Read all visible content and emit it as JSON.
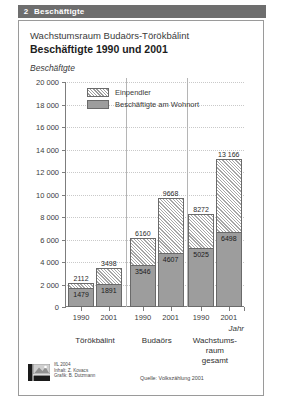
{
  "header": {
    "number": "2",
    "title": "Beschäftigte"
  },
  "figure": {
    "title": "Wachstumsraum Budaörs-Törökbálint",
    "subtitle": "Beschäftigte 1990 und 2001",
    "ylabel": "Beschäftgte",
    "xlabel": "Jahr"
  },
  "footer": {
    "credit_line_1": "IfL 2004",
    "credit_line_2": "Inhalt: Z. Kovacs",
    "credit_line_3": "Grafik: B. Dutzmann",
    "source": "Quelle: Volkszählung 2001"
  },
  "chart_data": {
    "type": "bar",
    "subtype": "stacked",
    "title": "Beschäftigte 1990 und 2001",
    "subtitle": "Wachstumsraum Budaörs-Törökbálint",
    "xlabel": "Jahr",
    "ylabel": "Beschäftgte",
    "ylim": [
      0,
      20000
    ],
    "ytick_values": [
      0,
      2000,
      4000,
      6000,
      8000,
      10000,
      12000,
      14000,
      16000,
      18000,
      20000
    ],
    "ytick_labels": [
      "0",
      "2 000",
      "4 000",
      "6 000",
      "8 000",
      "10 000",
      "12 000",
      "14 000",
      "16 000",
      "18 000",
      "20 000"
    ],
    "grid": true,
    "legend_position": "upper-left-inside",
    "groups": [
      "Törökbálint",
      "Budaörs",
      "Wachstums-\nraum gesamt"
    ],
    "categories": [
      "1990",
      "2001",
      "1990",
      "2001",
      "1990",
      "2001"
    ],
    "series": [
      {
        "name": "Beschäftigte am Wohnort",
        "color": "#9d9d9d",
        "fill": "solid",
        "values": [
          1479,
          1891,
          3546,
          4607,
          5025,
          6498
        ]
      },
      {
        "name": "Einpendler",
        "color": "#e8e8e8",
        "fill": "hatch",
        "values": [
          633,
          1607,
          2614,
          5061,
          3247,
          6668
        ]
      }
    ],
    "totals": [
      2112,
      3498,
      6160,
      9668,
      8272,
      13166
    ],
    "total_labels": [
      "2112",
      "3498",
      "6160",
      "9668",
      "8272",
      "13 166"
    ],
    "wohnort_labels": [
      "1479",
      "1891",
      "3546",
      "4607",
      "5025",
      "6498"
    ]
  }
}
